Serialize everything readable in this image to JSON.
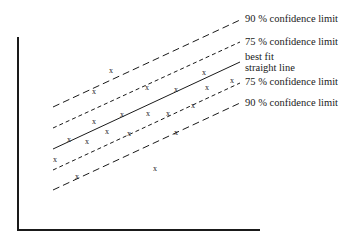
{
  "chart_data": {
    "type": "scatter",
    "title": "",
    "xlabel": "",
    "ylabel": "",
    "axes": {
      "y_axis": {
        "x": 18,
        "y1": 37,
        "y2": 231
      },
      "x_axis": {
        "y": 230,
        "x1": 18,
        "x2": 260
      },
      "ticks": false,
      "grid": false
    },
    "marker": "x",
    "points": [
      {
        "x": 111,
        "y": 70
      },
      {
        "x": 94,
        "y": 91
      },
      {
        "x": 147,
        "y": 87
      },
      {
        "x": 176,
        "y": 89
      },
      {
        "x": 204,
        "y": 72
      },
      {
        "x": 207,
        "y": 87
      },
      {
        "x": 232,
        "y": 80
      },
      {
        "x": 193,
        "y": 105
      },
      {
        "x": 94,
        "y": 121
      },
      {
        "x": 122,
        "y": 114
      },
      {
        "x": 148,
        "y": 113
      },
      {
        "x": 168,
        "y": 113
      },
      {
        "x": 107,
        "y": 131
      },
      {
        "x": 129,
        "y": 133
      },
      {
        "x": 176,
        "y": 132
      },
      {
        "x": 69,
        "y": 139
      },
      {
        "x": 87,
        "y": 141
      },
      {
        "x": 55,
        "y": 159
      },
      {
        "x": 77,
        "y": 176
      },
      {
        "x": 155,
        "y": 168
      }
    ],
    "lines": [
      {
        "name": "upper_90",
        "label": "90 % confidence limit",
        "style": "long-dash",
        "x1": 53,
        "y1": 107,
        "x2": 240,
        "y2": 20,
        "label_y": 22
      },
      {
        "name": "upper_75",
        "label": "75 % confidence limit",
        "style": "short-dash",
        "x1": 53,
        "y1": 128,
        "x2": 240,
        "y2": 42,
        "label_y": 44
      },
      {
        "name": "best_fit",
        "label": "best fit",
        "label2": "straight line",
        "style": "solid",
        "x1": 53,
        "y1": 149,
        "x2": 240,
        "y2": 62,
        "label_y": 60
      },
      {
        "name": "lower_75",
        "label": "75 % confidence limit",
        "style": "short-dash",
        "x1": 53,
        "y1": 170,
        "x2": 240,
        "y2": 83,
        "label_y": 85
      },
      {
        "name": "lower_90",
        "label": "90 % confidence limit",
        "style": "long-dash",
        "x1": 53,
        "y1": 190,
        "x2": 240,
        "y2": 103,
        "label_y": 105
      }
    ],
    "legend": "inline labels at right end of each line"
  },
  "labels": {
    "upper_90": "90 % confidence limit",
    "upper_75": "75 % confidence limit",
    "best_fit_1": "best fit",
    "best_fit_2": "straight line",
    "lower_75": "75 % confidence limit",
    "lower_90": "90 % confidence limit"
  },
  "marker_glyph": "x",
  "colors": {
    "ink": "#1a1a1a",
    "background": "#ffffff"
  }
}
